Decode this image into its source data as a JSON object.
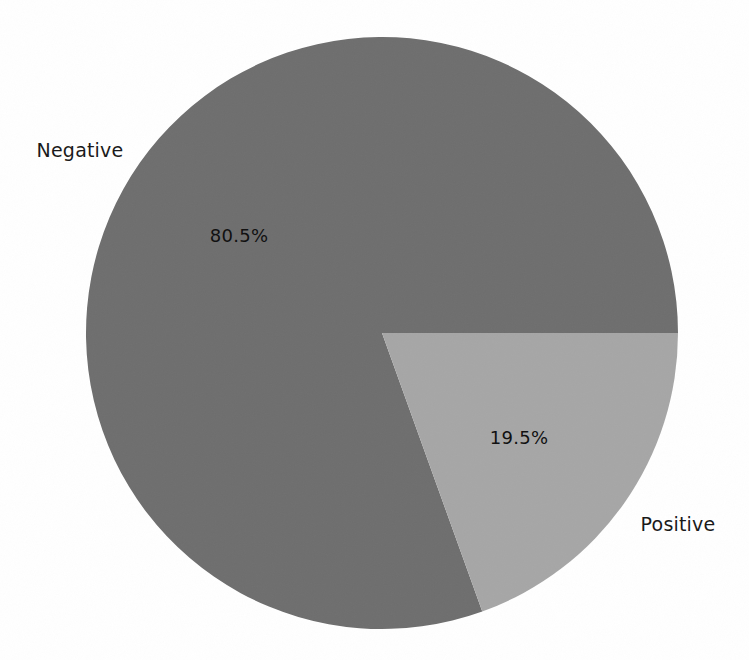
{
  "figure": {
    "background_color": "#ffffff",
    "width": 749,
    "height": 660
  },
  "chart_data": {
    "type": "pie",
    "title": "",
    "subtitle": "",
    "xlabel": "",
    "ylabel": "",
    "categories": [
      "Negative",
      "Positive"
    ],
    "values": [
      80.5,
      19.5
    ],
    "value_unit": "percent",
    "slice_labels": [
      "80.5%",
      "19.5%"
    ],
    "colors": [
      "#6e6e6e",
      "#a6a6a6"
    ],
    "legend": {
      "visible": false,
      "position": "none",
      "entries": [
        "Negative",
        "Positive"
      ]
    },
    "grid": false,
    "start_angle_deg": 0,
    "direction": "clockwise",
    "center": {
      "x": 382,
      "y": 333
    },
    "radius": 296,
    "annotations": [
      {
        "text": "Negative",
        "kind": "wedge-label",
        "x": 80,
        "y": 150
      },
      {
        "text": "80.5%",
        "kind": "wedge-percent",
        "x": 239,
        "y": 236
      },
      {
        "text": "Positive",
        "kind": "wedge-label",
        "x": 678,
        "y": 524
      },
      {
        "text": "19.5%",
        "kind": "wedge-percent",
        "x": 519,
        "y": 438
      }
    ]
  },
  "slices": [
    {
      "name": "negative",
      "label": "Negative",
      "percent_text": "80.5%",
      "value": 80.5,
      "color": "#6e6e6e"
    },
    {
      "name": "positive",
      "label": "Positive",
      "percent_text": "19.5%",
      "value": 19.5,
      "color": "#a6a6a6"
    }
  ]
}
